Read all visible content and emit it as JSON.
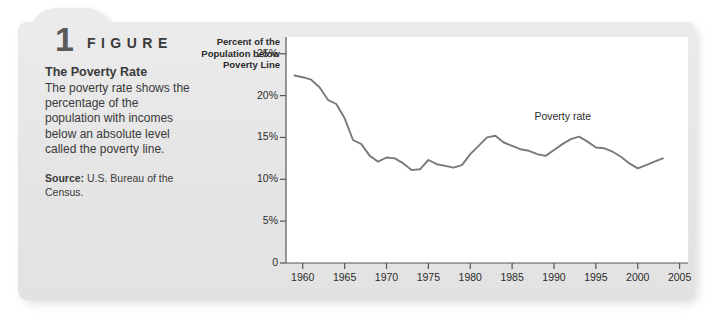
{
  "figure": {
    "number": "1",
    "word": "FIGURE",
    "title": "The Poverty Rate",
    "body": "The poverty rate shows the percentage of the population with incomes below an absolute level called the poverty line.",
    "source_label": "Source:",
    "source_text": "U.S. Bureau of the Census."
  },
  "colors": {
    "card": "#e6e6e6",
    "plot_background": "#ffffff",
    "line": "#7a7a7a",
    "axis": "#555555",
    "text": "#2b2b2b"
  },
  "chart_data": {
    "type": "line",
    "title": "The Poverty Rate",
    "xlabel": "",
    "ylabel": "Percent of the Population below Poverty Line",
    "xlim": [
      1958,
      2006
    ],
    "ylim": [
      0,
      27
    ],
    "grid": false,
    "legend_position": "inline-right",
    "y_ticks": [
      0,
      5,
      10,
      15,
      20,
      25
    ],
    "y_tick_labels": [
      "0",
      "5%",
      "10%",
      "15%",
      "20%",
      "25%"
    ],
    "x_ticks": [
      1960,
      1965,
      1970,
      1975,
      1980,
      1985,
      1990,
      1995,
      2000,
      2005
    ],
    "x_tick_labels": [
      "1960",
      "1965",
      "1970",
      "1975",
      "1980",
      "1985",
      "1990",
      "1995",
      "2000",
      "2005"
    ],
    "series": [
      {
        "name": "Poverty rate",
        "x": [
          1959,
          1960,
          1961,
          1962,
          1963,
          1964,
          1965,
          1966,
          1967,
          1968,
          1969,
          1970,
          1971,
          1972,
          1973,
          1974,
          1975,
          1976,
          1977,
          1978,
          1979,
          1980,
          1981,
          1982,
          1983,
          1984,
          1985,
          1986,
          1987,
          1988,
          1989,
          1990,
          1991,
          1992,
          1993,
          1994,
          1995,
          1996,
          1997,
          1998,
          1999,
          2000,
          2001,
          2002,
          2003
        ],
        "values": [
          22.4,
          22.2,
          21.9,
          21.0,
          19.5,
          19.0,
          17.3,
          14.7,
          14.2,
          12.8,
          12.1,
          12.6,
          12.5,
          11.9,
          11.1,
          11.2,
          12.3,
          11.8,
          11.6,
          11.4,
          11.7,
          13.0,
          14.0,
          15.0,
          15.2,
          14.4,
          14.0,
          13.6,
          13.4,
          13.0,
          12.8,
          13.5,
          14.2,
          14.8,
          15.1,
          14.5,
          13.8,
          13.7,
          13.3,
          12.7,
          11.9,
          11.3,
          11.7,
          12.1,
          12.5
        ]
      }
    ],
    "annotations": [
      {
        "text": "Poverty rate",
        "x": 1991,
        "y": 17.5
      }
    ]
  }
}
